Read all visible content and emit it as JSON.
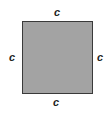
{
  "diagram": {
    "shape": "square",
    "fill_color": "#a3a3a3",
    "border_color": "#3a3a3a",
    "labels": {
      "top": "c",
      "bottom": "c",
      "left": "c",
      "right": "c"
    }
  }
}
